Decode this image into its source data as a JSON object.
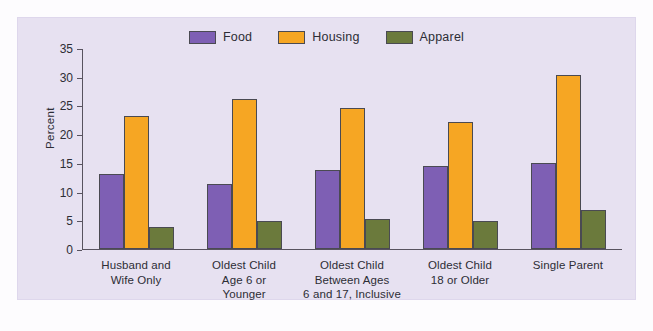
{
  "chart_data": {
    "type": "bar",
    "title": "",
    "subtitle": "",
    "xlabel": "",
    "ylabel": "Percent",
    "ylim": [
      0,
      35
    ],
    "yticks": [
      0,
      5,
      10,
      15,
      20,
      25,
      30,
      35
    ],
    "ytick_labels": [
      "0",
      "5",
      "10",
      "15",
      "20",
      "25",
      "30",
      "35"
    ],
    "grid": false,
    "legend_position": "top-center",
    "categories": [
      "Husband and\nWife Only",
      "Oldest Child\nAge 6 or\nYounger",
      "Oldest Child\nBetween Ages\n6 and 17, Inclusive",
      "Oldest Child\n18 or Older",
      "Single Parent"
    ],
    "category_lines": [
      [
        "Husband and",
        "Wife Only"
      ],
      [
        "Oldest Child",
        "Age 6 or",
        "Younger"
      ],
      [
        "Oldest Child",
        "Between Ages",
        "6 and 17, Inclusive"
      ],
      [
        "Oldest Child",
        "18 or Older"
      ],
      [
        "Single Parent"
      ]
    ],
    "series": [
      {
        "name": "Food",
        "color": "#7e5fb4",
        "values": [
          13.0,
          11.3,
          13.8,
          14.5,
          15.0
        ]
      },
      {
        "name": "Housing",
        "color": "#f6a623",
        "values": [
          23.2,
          26.1,
          24.6,
          22.2,
          30.3
        ]
      },
      {
        "name": "Apparel",
        "color": "#6b7a3c",
        "values": [
          3.8,
          4.9,
          5.2,
          4.9,
          6.8
        ]
      }
    ]
  },
  "colors": {
    "panel_background": "#e7e1f1",
    "page_background": "#fdfcfe",
    "axis": "#58535f",
    "text": "#2d2d35",
    "bar_outline": "#4a4a52",
    "food": "#7e5fb4",
    "housing": "#f6a623",
    "apparel": "#6b7a3c"
  }
}
